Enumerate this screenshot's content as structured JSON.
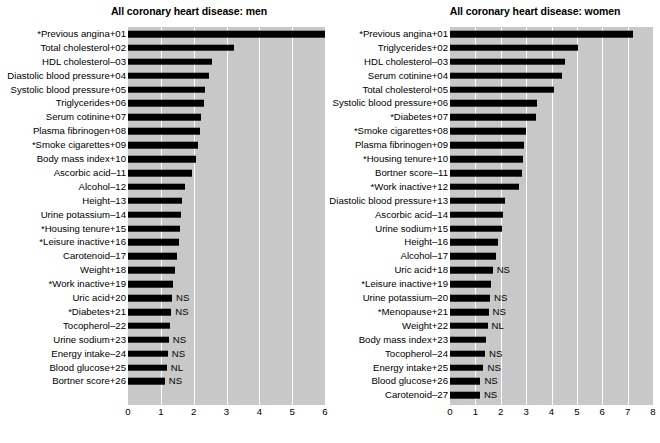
{
  "figure": {
    "background": "#ffffff",
    "plot_background": "#c8c8c8",
    "bar_color": "#000000",
    "gridline_color": "#ffffff"
  },
  "chart_data": [
    {
      "type": "bar",
      "orientation": "horizontal",
      "title": "All coronary heart disease: men",
      "xlabel": "",
      "ylabel": "",
      "xlim": [
        0,
        6
      ],
      "xticks": [
        0,
        1,
        2,
        3,
        4,
        5,
        6
      ],
      "xticklabels": [
        "0",
        "1",
        "2",
        "3",
        "4",
        "5",
        "6"
      ],
      "grid": true,
      "legend": "none",
      "categories": [
        "*Previous angina+01",
        "Total cholesterol+02",
        "HDL cholesterol–03",
        "Diastolic blood pressure+04",
        "Systolic blood pressure+05",
        "Triglycerides+06",
        "Serum cotinine+07",
        "Plasma fibrinogen+08",
        "*Smoke cigarettes+09",
        "Body mass index+10",
        "Ascorbic acid–11",
        "Alcohol–12",
        "Height–13",
        "Urine potassium–14",
        "*Housing tenure+15",
        "*Leisure inactive+16",
        "Carotenoid–17",
        "Weight+18",
        "*Work inactive+19",
        "Uric acid+20",
        "*Diabetes+21",
        "Tocopherol–22",
        "Urine sodium+23",
        "Energy intake–24",
        "Blood glucose+25",
        "Bortner score+26"
      ],
      "values": [
        6.0,
        3.22,
        2.56,
        2.48,
        2.35,
        2.3,
        2.22,
        2.18,
        2.12,
        2.08,
        1.96,
        1.74,
        1.65,
        1.6,
        1.58,
        1.54,
        1.5,
        1.42,
        1.38,
        1.34,
        1.32,
        1.28,
        1.24,
        1.21,
        1.18,
        1.12
      ],
      "annotations": [
        "",
        "",
        "",
        "",
        "",
        "",
        "",
        "",
        "",
        "",
        "",
        "",
        "",
        "",
        "",
        "",
        "",
        "",
        "",
        "NS",
        "NS",
        "",
        "NS",
        "NS",
        "NL",
        "NS"
      ]
    },
    {
      "type": "bar",
      "orientation": "horizontal",
      "title": "All coronary heart disease: women",
      "xlabel": "",
      "ylabel": "",
      "xlim": [
        0,
        8
      ],
      "xticks": [
        0,
        1,
        2,
        3,
        4,
        5,
        6,
        7,
        8
      ],
      "xticklabels": [
        "0",
        "1",
        "2",
        "3",
        "4",
        "5",
        "6",
        "7",
        "8"
      ],
      "grid": true,
      "legend": "none",
      "categories": [
        "*Previous angina+01",
        "Triglycerides+02",
        "HDL cholesterol–03",
        "Serum cotinine+04",
        "Total cholesterol+05",
        "Systolic blood pressure+06",
        "*Diabetes+07",
        "*Smoke cigarettes+08",
        "Plasma fibrinogen+09",
        "*Housing tenure+10",
        "Bortner score–11",
        "*Work inactive+12",
        "Diastolic blood pressure+13",
        "Ascorbic acid–14",
        "Urine sodium+15",
        "Height–16",
        "Alcohol–17",
        "Uric acid+18",
        "*Leisure inactive+19",
        "Urine potassium–20",
        "*Menopause+21",
        "Weight+22",
        "Body mass index+23",
        "Tocopherol–24",
        "Energy intake+25",
        "Blood glucose+26",
        "Carotenoid–27"
      ],
      "values": [
        7.22,
        5.05,
        4.55,
        4.42,
        4.1,
        3.42,
        3.38,
        3.0,
        2.92,
        2.88,
        2.82,
        2.7,
        2.15,
        2.08,
        2.05,
        1.88,
        1.82,
        1.68,
        1.62,
        1.58,
        1.52,
        1.48,
        1.42,
        1.38,
        1.32,
        1.2,
        1.18
      ],
      "annotations": [
        "",
        "",
        "",
        "",
        "",
        "",
        "",
        "",
        "",
        "",
        "",
        "",
        "",
        "",
        "",
        "",
        "",
        "NS",
        "",
        "NS",
        "NS",
        "NL",
        "",
        "NS",
        "NS",
        "NS",
        "NS"
      ]
    }
  ]
}
